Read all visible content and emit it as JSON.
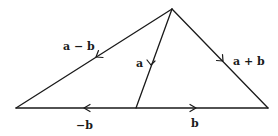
{
  "diagram": {
    "title": "",
    "points": {
      "apex": [
        172,
        9
      ],
      "left": [
        16,
        108
      ],
      "right": [
        268,
        108
      ],
      "mid": [
        136,
        108
      ]
    },
    "vectors": [
      {
        "id": "a-minus-b",
        "label": "a − b",
        "from": "apex",
        "to": "left",
        "arrow_at": [
          96,
          57
        ],
        "label_pos": [
          63,
          40
        ]
      },
      {
        "id": "a",
        "label": "a",
        "from": "apex",
        "to": "mid",
        "arrow_at": [
          151,
          65
        ],
        "label_pos": [
          136,
          56
        ]
      },
      {
        "id": "a-plus-b",
        "label": "a + b",
        "from": "apex",
        "to": "right",
        "arrow_at": [
          223,
          61
        ],
        "label_pos": [
          233,
          56
        ]
      },
      {
        "id": "neg-b",
        "label": "−b",
        "from": "mid",
        "to": "left",
        "arrow_at": [
          84,
          108
        ],
        "label_pos": [
          76,
          120
        ]
      },
      {
        "id": "b",
        "label": "b",
        "from": "mid",
        "to": "right",
        "arrow_at": [
          196,
          108
        ],
        "label_pos": [
          191,
          118
        ]
      }
    ],
    "colors": {
      "stroke": "#1a1a1a",
      "background": "#ffffff"
    }
  }
}
